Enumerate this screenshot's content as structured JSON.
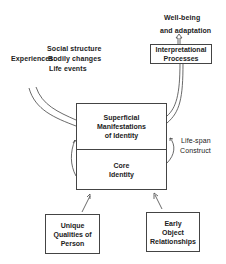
{
  "diagram": {
    "experiences": {
      "label": "Experiences:",
      "items": [
        "Social structure",
        "Bodily changes",
        "Life events"
      ]
    },
    "outcome": {
      "line1": "Well-being",
      "line2": "and adaptation"
    },
    "interpretational_box": {
      "line1": "Interpretational",
      "line2": "Processes"
    },
    "identity_box": {
      "superficial": [
        "Superficial",
        "Manifestations",
        "of Identity"
      ],
      "core": [
        "Core",
        "Identity"
      ]
    },
    "lifespan": {
      "line1": "Life-span",
      "line2": "Construct"
    },
    "unique_box": [
      "Unique",
      "Qualities of",
      "Person"
    ],
    "early_box": [
      "Early",
      "Object",
      "Relationships"
    ]
  }
}
